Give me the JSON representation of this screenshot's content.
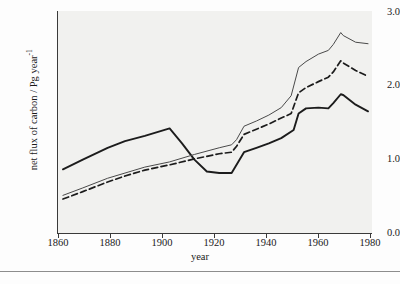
{
  "figure": {
    "background_color": "#f1f1ef",
    "page_color": "#fdfdfd",
    "axis_color": "#3a3a3a"
  },
  "axes": {
    "x_title": "year",
    "y_title_main": "net flux of carbon / Pg year",
    "y_title_exponent": "-1",
    "x_ticks": [
      "1860",
      "1880",
      "1900",
      "1920",
      "1940",
      "1960",
      "1980"
    ],
    "y_ticks": [
      "0.0",
      "1.0",
      "2.0",
      "3.0"
    ]
  },
  "chart_data": {
    "type": "line",
    "title": "",
    "xlabel": "year",
    "ylabel": "net flux of carbon / Pg year-1",
    "xlim": [
      1855,
      1982
    ],
    "ylim": [
      0.0,
      3.0
    ],
    "xticks": [
      1860,
      1880,
      1900,
      1920,
      1940,
      1960,
      1980
    ],
    "yticks": [
      0.0,
      1.0,
      2.0,
      3.0
    ],
    "y_minor_ticks": [
      0.5,
      1.5,
      2.5
    ],
    "grid": false,
    "legend": "none",
    "series": [
      {
        "name": "thick-solid",
        "style": "solid",
        "width": 1.9,
        "color": "#1c1c1c",
        "x": [
          1857,
          1865,
          1875,
          1882,
          1890,
          1900,
          1900,
          1905,
          1910,
          1915,
          1920,
          1925,
          1925,
          1930,
          1935,
          1940,
          1945,
          1950,
          1952,
          1955,
          1960,
          1964,
          1966,
          1969,
          1970,
          1975,
          1980
        ],
        "y": [
          0.87,
          1.0,
          1.16,
          1.25,
          1.32,
          1.42,
          1.42,
          1.22,
          1.0,
          0.84,
          0.82,
          0.82,
          0.82,
          1.1,
          1.16,
          1.22,
          1.29,
          1.4,
          1.62,
          1.69,
          1.7,
          1.69,
          1.76,
          1.88,
          1.87,
          1.74,
          1.65
        ]
      },
      {
        "name": "thin-solid",
        "style": "solid",
        "width": 1.0,
        "color": "#4a4a4a",
        "x": [
          1857,
          1865,
          1875,
          1882,
          1890,
          1900,
          1910,
          1920,
          1925,
          1927,
          1930,
          1935,
          1940,
          1945,
          1949,
          1952,
          1955,
          1960,
          1964,
          1966,
          1969,
          1970,
          1975,
          1980
        ],
        "y": [
          0.52,
          0.62,
          0.75,
          0.82,
          0.9,
          0.97,
          1.07,
          1.16,
          1.2,
          1.27,
          1.45,
          1.52,
          1.6,
          1.7,
          1.86,
          2.24,
          2.32,
          2.42,
          2.47,
          2.55,
          2.71,
          2.67,
          2.58,
          2.56
        ]
      },
      {
        "name": "dashed",
        "style": "dashed",
        "width": 1.7,
        "color": "#1c1c1c",
        "x": [
          1857,
          1865,
          1875,
          1882,
          1890,
          1900,
          1910,
          1920,
          1925,
          1927,
          1930,
          1935,
          1940,
          1945,
          1949,
          1952,
          1955,
          1960,
          1964,
          1966,
          1969,
          1970,
          1975,
          1980
        ],
        "y": [
          0.47,
          0.57,
          0.7,
          0.78,
          0.86,
          0.93,
          1.01,
          1.08,
          1.1,
          1.18,
          1.34,
          1.41,
          1.48,
          1.56,
          1.62,
          1.9,
          1.97,
          2.05,
          2.11,
          2.18,
          2.33,
          2.3,
          2.2,
          2.12
        ]
      }
    ]
  }
}
